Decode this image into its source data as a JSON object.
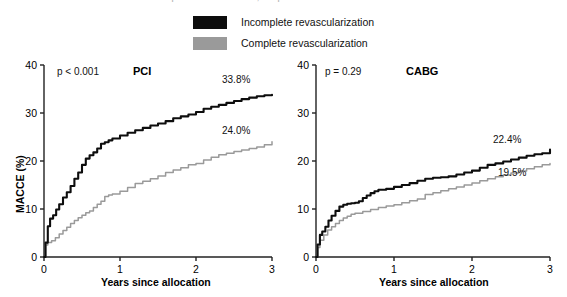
{
  "figure": {
    "top_title_remnant": "Incomplete revascularization, complete revascularization and outcomes"
  },
  "legend": {
    "position": "top-center",
    "items": [
      {
        "label": "Incomplete revascularization",
        "color": "#0d0d0d",
        "swatch_name": "legend-swatch-incomplete"
      },
      {
        "label": "Complete revascularization",
        "color": "#9a9a9a",
        "swatch_name": "legend-swatch-complete"
      }
    ]
  },
  "colors": {
    "incomplete": "#0d0d0d",
    "complete": "#9a9a9a",
    "axis": "#222222",
    "text": "#111111"
  },
  "axes": {
    "x_label": "Years since allocation",
    "y_label": "MACCE (%)",
    "x_ticks": [
      "0",
      "1",
      "2",
      "3"
    ],
    "y_ticks": [
      "0",
      "10",
      "20",
      "30",
      "40"
    ],
    "xlim": [
      0,
      3
    ],
    "ylim": [
      0,
      40
    ]
  },
  "panels": [
    {
      "key": "pci",
      "title": "PCI",
      "pvalue": "p < 0.001",
      "end_labels": [
        {
          "text": "33.8%",
          "series": "Incomplete revascularization"
        },
        {
          "text": "24.0%",
          "series": "Complete revascularization"
        }
      ]
    },
    {
      "key": "cabg",
      "title": "CABG",
      "pvalue": "p = 0.29",
      "end_labels": [
        {
          "text": "22.4%",
          "series": "Incomplete revascularization"
        },
        {
          "text": "19.5%",
          "series": "Complete revascularization"
        }
      ]
    }
  ],
  "chart_data": [
    {
      "type": "line",
      "title": "PCI",
      "subtitle": "p < 0.001",
      "xlabel": "Years since allocation",
      "ylabel": "MACCE (%)",
      "xlim": [
        0,
        3
      ],
      "ylim": [
        0,
        40
      ],
      "xticks": [
        0,
        1,
        2,
        3
      ],
      "yticks": [
        0,
        10,
        20,
        30,
        40
      ],
      "grid": false,
      "legend_position": "above-figure",
      "annotations": [
        "p < 0.001",
        "33.8%",
        "24.0%"
      ],
      "series": [
        {
          "name": "Incomplete revascularization",
          "color": "#0d0d0d",
          "final_value": 33.8,
          "x": [
            0,
            0.02,
            0.05,
            0.08,
            0.12,
            0.16,
            0.2,
            0.25,
            0.3,
            0.35,
            0.4,
            0.45,
            0.5,
            0.55,
            0.6,
            0.65,
            0.7,
            0.75,
            0.8,
            0.85,
            0.9,
            1.0,
            1.1,
            1.2,
            1.3,
            1.4,
            1.5,
            1.6,
            1.7,
            1.8,
            1.9,
            2.0,
            2.1,
            2.2,
            2.3,
            2.4,
            2.5,
            2.6,
            2.7,
            2.8,
            2.9,
            3.0
          ],
          "y": [
            0.0,
            3.0,
            6.4,
            8.0,
            8.7,
            9.9,
            11.0,
            12.4,
            13.5,
            14.8,
            16.3,
            17.6,
            19.2,
            20.5,
            21.2,
            21.8,
            22.6,
            23.6,
            23.9,
            24.3,
            24.7,
            25.3,
            25.9,
            26.4,
            26.9,
            27.4,
            27.8,
            28.3,
            28.9,
            29.3,
            29.7,
            30.2,
            30.9,
            31.3,
            31.7,
            32.1,
            32.5,
            32.9,
            33.2,
            33.5,
            33.7,
            33.8
          ]
        },
        {
          "name": "Complete revascularization",
          "color": "#9a9a9a",
          "final_value": 24.0,
          "x": [
            0,
            0.02,
            0.05,
            0.1,
            0.15,
            0.2,
            0.25,
            0.3,
            0.35,
            0.4,
            0.45,
            0.5,
            0.55,
            0.6,
            0.65,
            0.7,
            0.75,
            0.8,
            0.85,
            0.9,
            1.0,
            1.1,
            1.2,
            1.3,
            1.4,
            1.5,
            1.6,
            1.7,
            1.8,
            1.9,
            2.0,
            2.1,
            2.2,
            2.3,
            2.4,
            2.5,
            2.6,
            2.7,
            2.8,
            2.9,
            3.0
          ],
          "y": [
            0.0,
            2.5,
            3.0,
            3.4,
            4.0,
            4.8,
            5.5,
            6.2,
            7.0,
            7.6,
            8.2,
            8.7,
            9.2,
            9.6,
            10.3,
            11.0,
            11.6,
            12.6,
            12.9,
            13.1,
            13.7,
            14.5,
            15.3,
            15.8,
            16.3,
            16.9,
            17.6,
            18.1,
            18.6,
            19.2,
            19.5,
            20.2,
            20.8,
            21.3,
            21.6,
            22.0,
            22.3,
            22.6,
            22.9,
            23.4,
            24.0
          ]
        }
      ]
    },
    {
      "type": "line",
      "title": "CABG",
      "subtitle": "p = 0.29",
      "xlabel": "Years since allocation",
      "ylabel": "MACCE (%)",
      "xlim": [
        0,
        3
      ],
      "ylim": [
        0,
        40
      ],
      "xticks": [
        0,
        1,
        2,
        3
      ],
      "yticks": [
        0,
        10,
        20,
        30,
        40
      ],
      "grid": false,
      "legend_position": "above-figure",
      "annotations": [
        "p = 0.29",
        "22.4%",
        "19.5%"
      ],
      "series": [
        {
          "name": "Incomplete revascularization",
          "color": "#0d0d0d",
          "final_value": 22.4,
          "x": [
            0,
            0.02,
            0.05,
            0.08,
            0.12,
            0.16,
            0.2,
            0.25,
            0.3,
            0.35,
            0.4,
            0.45,
            0.5,
            0.55,
            0.6,
            0.65,
            0.7,
            0.75,
            0.8,
            0.9,
            1.0,
            1.1,
            1.2,
            1.3,
            1.4,
            1.5,
            1.6,
            1.7,
            1.8,
            1.9,
            2.0,
            2.1,
            2.2,
            2.3,
            2.4,
            2.5,
            2.6,
            2.7,
            2.8,
            2.9,
            3.0
          ],
          "y": [
            0.0,
            2.6,
            4.6,
            5.3,
            6.3,
            7.6,
            8.6,
            9.6,
            10.5,
            10.9,
            11.1,
            11.2,
            11.3,
            11.6,
            12.3,
            12.8,
            13.3,
            13.7,
            14.0,
            14.2,
            14.6,
            15.0,
            15.4,
            15.9,
            16.3,
            16.5,
            16.6,
            16.8,
            17.2,
            17.6,
            18.0,
            18.6,
            19.2,
            19.5,
            19.9,
            20.3,
            20.7,
            21.1,
            21.4,
            21.6,
            22.4
          ]
        },
        {
          "name": "Complete revascularization",
          "color": "#9a9a9a",
          "final_value": 19.5,
          "x": [
            0,
            0.02,
            0.05,
            0.1,
            0.15,
            0.2,
            0.25,
            0.3,
            0.35,
            0.4,
            0.45,
            0.5,
            0.6,
            0.7,
            0.8,
            0.9,
            1.0,
            1.1,
            1.2,
            1.3,
            1.4,
            1.5,
            1.6,
            1.7,
            1.8,
            1.9,
            2.0,
            2.1,
            2.2,
            2.3,
            2.4,
            2.5,
            2.6,
            2.7,
            2.8,
            2.9,
            3.0
          ],
          "y": [
            0.0,
            2.0,
            3.5,
            4.6,
            5.6,
            6.3,
            7.0,
            7.6,
            8.1,
            8.5,
            8.9,
            9.1,
            9.5,
            9.9,
            10.3,
            10.6,
            10.9,
            11.3,
            11.7,
            12.1,
            13.0,
            13.4,
            13.8,
            14.2,
            14.6,
            15.0,
            15.4,
            15.9,
            16.3,
            16.7,
            17.1,
            17.5,
            17.9,
            18.4,
            18.8,
            19.2,
            19.5
          ]
        }
      ]
    }
  ]
}
